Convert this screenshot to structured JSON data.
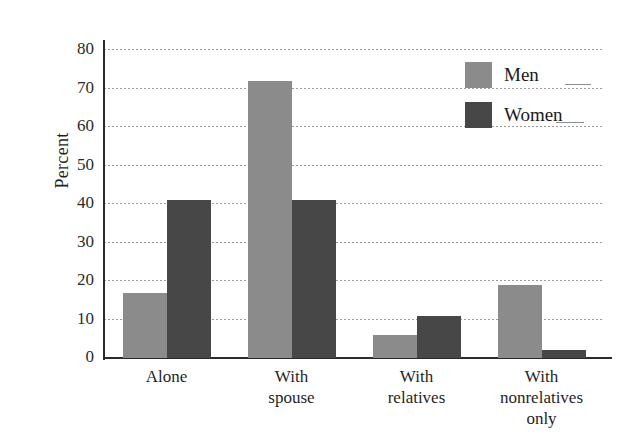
{
  "chart_data": {
    "type": "bar",
    "title": "",
    "xlabel": "",
    "ylabel": "Percent",
    "ylim": [
      0,
      80
    ],
    "ytick_step": 10,
    "yticks": [
      0,
      10,
      20,
      30,
      40,
      50,
      60,
      70,
      80
    ],
    "grid": true,
    "legend_position": "top-right",
    "categories": [
      "Alone",
      "With spouse",
      "With relatives",
      "With nonrelatives only"
    ],
    "category_lines": [
      [
        "Alone"
      ],
      [
        "With",
        "spouse"
      ],
      [
        "With",
        "relatives"
      ],
      [
        "With",
        "nonrelatives",
        "only"
      ]
    ],
    "series": [
      {
        "name": "Men",
        "color": "#8b8b8b",
        "values": [
          17,
          72,
          6,
          19
        ]
      },
      {
        "name": "Women",
        "color": "#474747",
        "values": [
          41,
          41,
          11,
          2
        ]
      }
    ]
  },
  "axis": {
    "y_label": "Percent",
    "y_ticks": [
      "80",
      "70",
      "60",
      "50",
      "40",
      "30",
      "20",
      "10",
      "0"
    ]
  },
  "legend": {
    "items": [
      {
        "label": "Men",
        "color": "#8b8b8b"
      },
      {
        "label": "Women",
        "color": "#474747"
      }
    ]
  },
  "x_axis_labels": [
    {
      "line1": "Alone",
      "line2": "",
      "line3": ""
    },
    {
      "line1": "With",
      "line2": "spouse",
      "line3": ""
    },
    {
      "line1": "With",
      "line2": "relatives",
      "line3": ""
    },
    {
      "line1": "With",
      "line2": "nonrelatives",
      "line3": "only"
    }
  ],
  "colors": {
    "men": "#8b8b8b",
    "women": "#474747",
    "axis": "#2b2b2b",
    "grid": "#9a9a9a",
    "background": "#ffffff"
  }
}
